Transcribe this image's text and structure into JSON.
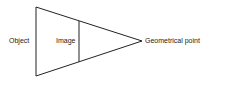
{
  "diagram": {
    "labels": {
      "object": "Object",
      "image": "Image",
      "point": "Geometrical point"
    },
    "colors": {
      "line": "#222222",
      "text": "#222222",
      "background": "#ffffff"
    }
  }
}
